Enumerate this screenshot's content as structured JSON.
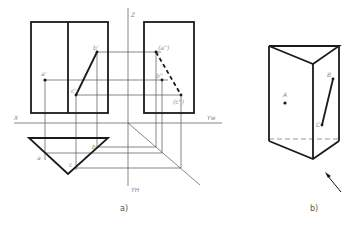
{
  "figure_a": {
    "caption": "a)",
    "axis_labels": {
      "x": "X",
      "z": "Z",
      "yw": "Yw",
      "yh": "YH"
    },
    "front_view_labels": {
      "a": "a'",
      "b": "b'",
      "c": "c'"
    },
    "side_view_labels": {
      "a": "(a'')",
      "b": "b''",
      "c": "(c'')"
    },
    "top_view_labels": {
      "a": "a",
      "b": "b",
      "c": "c"
    }
  },
  "figure_b": {
    "caption": "b)",
    "point_labels": {
      "a": "A",
      "b": "B",
      "c": "C"
    }
  },
  "colors": {
    "line": "#1a1a1a",
    "construction": "#555555",
    "label": "#888888",
    "hidden": "#999999"
  }
}
